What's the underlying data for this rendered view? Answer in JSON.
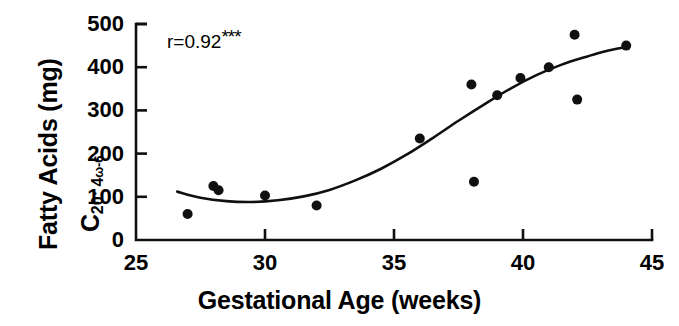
{
  "chart_data": {
    "type": "scatter",
    "title": "",
    "xlabel": "Gestational Age (weeks)",
    "ylabel_line1": "Fatty Acids (mg)",
    "ylabel_line2_base": "C",
    "ylabel_line2_sub": "20: 4",
    "ylabel_line2_omega": "ω-6",
    "xlim": [
      25,
      45
    ],
    "ylim": [
      0,
      500
    ],
    "xticks": [
      25,
      30,
      35,
      40,
      45
    ],
    "yticks": [
      0,
      100,
      200,
      300,
      400,
      500
    ],
    "xticklabels": [
      "25",
      "30",
      "35",
      "40",
      "45"
    ],
    "yticklabels": [
      "0",
      "100",
      "200",
      "300",
      "400",
      "500"
    ],
    "grid": false,
    "legend": false,
    "annotation": "r=0.92",
    "annotation_stars": "***",
    "marker_color": "#101010",
    "marker_size": 9,
    "line_color": "#101010",
    "axis_color": "#101010",
    "points": [
      {
        "x": 27.0,
        "y": 60
      },
      {
        "x": 28.0,
        "y": 125
      },
      {
        "x": 28.2,
        "y": 115
      },
      {
        "x": 30.0,
        "y": 103
      },
      {
        "x": 32.0,
        "y": 80
      },
      {
        "x": 36.0,
        "y": 235
      },
      {
        "x": 38.0,
        "y": 360
      },
      {
        "x": 38.1,
        "y": 135
      },
      {
        "x": 39.0,
        "y": 335
      },
      {
        "x": 39.9,
        "y": 375
      },
      {
        "x": 41.0,
        "y": 400
      },
      {
        "x": 42.0,
        "y": 475
      },
      {
        "x": 42.1,
        "y": 325
      },
      {
        "x": 44.0,
        "y": 450
      }
    ],
    "fit_curve": [
      {
        "x": 26.6,
        "y": 112
      },
      {
        "x": 27.5,
        "y": 98
      },
      {
        "x": 28.5,
        "y": 90
      },
      {
        "x": 29.5,
        "y": 88
      },
      {
        "x": 30.5,
        "y": 92
      },
      {
        "x": 31.5,
        "y": 101
      },
      {
        "x": 32.5,
        "y": 116
      },
      {
        "x": 33.5,
        "y": 138
      },
      {
        "x": 34.5,
        "y": 165
      },
      {
        "x": 35.5,
        "y": 198
      },
      {
        "x": 36.5,
        "y": 236
      },
      {
        "x": 37.5,
        "y": 276
      },
      {
        "x": 38.5,
        "y": 314
      },
      {
        "x": 39.5,
        "y": 350
      },
      {
        "x": 40.5,
        "y": 381
      },
      {
        "x": 41.5,
        "y": 406
      },
      {
        "x": 42.5,
        "y": 425
      },
      {
        "x": 43.2,
        "y": 437
      },
      {
        "x": 44.0,
        "y": 447
      }
    ]
  }
}
